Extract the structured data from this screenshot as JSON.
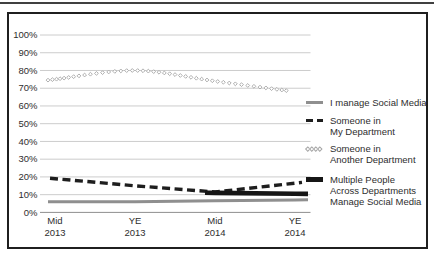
{
  "figure": {
    "background": "#ffffff",
    "colors": {
      "top_rule": "#404040",
      "frame_border": "#1f1f1f",
      "gridline": "#cccccc",
      "zero_axis_line": "#8f8f8f",
      "text": "#2e2e2e"
    }
  },
  "chart_data": {
    "type": "line",
    "title": "",
    "xlabel": "",
    "ylabel": "",
    "categories": [
      "Mid\n2013",
      "YE\n2013",
      "Mid\n2014",
      "YE\n2014"
    ],
    "yticks": [
      "0%",
      "10%",
      "20%",
      "30%",
      "40%",
      "50%",
      "60%",
      "70%",
      "80%",
      "90%",
      "100%"
    ],
    "ylim": [
      0,
      100
    ],
    "grid": true,
    "legend_position": "right",
    "series": [
      {
        "name": "I manage Social Media",
        "values": [
          6,
          6,
          6.5,
          7
        ],
        "style": "solid",
        "color": "#8f8f8f",
        "width": 3
      },
      {
        "name": "Someone in\nMy Department",
        "values": [
          19,
          15,
          11.5,
          16.5
        ],
        "style": "dashed",
        "color": "#1e1e1e",
        "width": 3.4
      },
      {
        "name": "Someone in\nAnother Department",
        "values": [
          75,
          80,
          74,
          68
        ],
        "style": "diamond-open-markers",
        "color": "#a6a6a6",
        "width": 0.9
      },
      {
        "name": "Multiple People\nAcross Departments\nManage Social Media",
        "values": [
          null,
          null,
          11,
          10.5
        ],
        "style": "solid",
        "color": "#161616",
        "width": 4.6
      }
    ]
  }
}
